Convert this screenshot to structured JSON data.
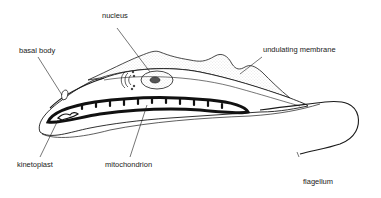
{
  "diagram": {
    "labels": {
      "nucleus": "nucleus",
      "basal_body": "basal body",
      "undulating_membrane": "undulating membrane",
      "kinetoplast": "kinetoplast",
      "mitochondrion": "mitochondrion",
      "flagellum": "flagellum"
    },
    "colors": {
      "line": "#1a1a1a",
      "stipple": "#9a9a9a",
      "background": "#ffffff"
    }
  }
}
